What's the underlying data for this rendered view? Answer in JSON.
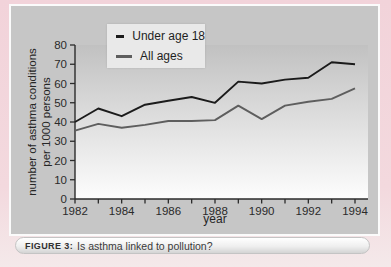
{
  "figure": {
    "caption_label": "FIGURE 3:",
    "caption_text": "Is asthma linked to pollution?"
  },
  "chart_data": {
    "type": "line",
    "x": [
      1982,
      1983,
      1984,
      1985,
      1986,
      1987,
      1988,
      1989,
      1990,
      1991,
      1992,
      1993,
      1994
    ],
    "series": [
      {
        "name": "Under age 18",
        "color": "#1b1b1b",
        "values": [
          40,
          47,
          43,
          49,
          51,
          53,
          50,
          61,
          60,
          62,
          63,
          71,
          70
        ]
      },
      {
        "name": "All ages",
        "color": "#5e5e5e",
        "values": [
          35.5,
          39,
          37,
          38.5,
          40.5,
          40.5,
          41,
          48.5,
          41.5,
          48.5,
          50.5,
          52,
          57.5
        ]
      }
    ],
    "xlabel": "year",
    "ylabel_lines": [
      "number of asthma conditions",
      "per 1000 persons"
    ],
    "ylim": [
      0,
      80
    ],
    "ytick_step": 10,
    "xtick_labels_shown": [
      "1982",
      "1984",
      "1986",
      "1988",
      "1990",
      "1992",
      "1994"
    ],
    "legend_position": "top-left",
    "grid": false
  },
  "colors": {
    "page_background": "#f3d7dc",
    "panel_background": "#c6c6c6",
    "plot_gradient_top": "#c1c1c1",
    "plot_gradient_bottom": "#fdfdfd",
    "axis": "#2b2b2b",
    "legend_background": "#e9e9e9"
  }
}
